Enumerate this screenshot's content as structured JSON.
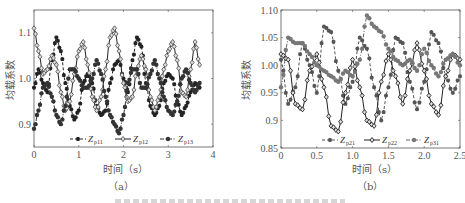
{
  "figure": {
    "panels": [
      {
        "id": "a",
        "sublabel": "（a）",
        "xlabel": "时间（s）",
        "ylabel": "均载系数",
        "xticks": [
          "0",
          "1",
          "2",
          "3",
          "4"
        ],
        "yticks": [
          "0.9",
          "1.0",
          "1.1"
        ],
        "legend": [
          {
            "base": "-Z",
            "sub": "p11"
          },
          {
            "base": "Z",
            "sub": "p12"
          },
          {
            "base": "Z",
            "sub": "p13"
          }
        ]
      },
      {
        "id": "b",
        "sublabel": "（b）",
        "xlabel": "时间（s）",
        "ylabel": "均载系数",
        "xticks": [
          "0",
          "0.5",
          "1.0",
          "1.5",
          "2.0",
          "2.5"
        ],
        "yticks": [
          "0.85",
          "0.9",
          "0.95",
          "1.00",
          "1.05",
          "1.10"
        ],
        "legend": [
          {
            "base": "Z",
            "sub": "p21"
          },
          {
            "base": "Z",
            "sub": "p22"
          },
          {
            "base": "Z",
            "sub": "p31"
          }
        ]
      }
    ]
  },
  "chart_data": [
    {
      "type": "line",
      "title": "(a)",
      "xlabel": "时间（s）",
      "ylabel": "均载系数",
      "xlim": [
        0,
        4
      ],
      "ylim": [
        0.85,
        1.15
      ],
      "xticks": [
        0,
        1,
        2,
        3,
        4
      ],
      "yticks": [
        0.9,
        1.0,
        1.1
      ],
      "grid": false,
      "legend_position": "bottom-inside",
      "series": [
        {
          "name": "Z_p11",
          "style": "dashed, star markers",
          "x": [
            0,
            0.1,
            0.2,
            0.3,
            0.4,
            0.5,
            0.6,
            0.7,
            0.8,
            0.9,
            1.0,
            1.1,
            1.2,
            1.3,
            1.4,
            1.5,
            1.6,
            1.7,
            1.8,
            1.9,
            2.0,
            2.1,
            2.2,
            2.3,
            2.4,
            2.5,
            2.6,
            2.7,
            2.8,
            2.9,
            3.0,
            3.1,
            3.2,
            3.3,
            3.4,
            3.5,
            3.6,
            3.7
          ],
          "values": [
            0.98,
            1.02,
            0.99,
            0.97,
            1.04,
            1.09,
            1.06,
            0.99,
            0.94,
            0.91,
            0.93,
            0.99,
            1.01,
            0.99,
            0.94,
            0.92,
            0.93,
            0.99,
            1.03,
            1.04,
            1.0,
            0.97,
            1.04,
            1.09,
            1.07,
            0.99,
            0.94,
            0.92,
            0.94,
            0.99,
            1.01,
            1.0,
            0.95,
            0.92,
            0.94,
            0.97,
            0.99,
            0.98
          ]
        },
        {
          "name": "Z_p12",
          "style": "solid, diamond markers",
          "x": [
            0,
            0.1,
            0.2,
            0.3,
            0.4,
            0.5,
            0.6,
            0.7,
            0.8,
            0.9,
            1.0,
            1.1,
            1.2,
            1.3,
            1.4,
            1.5,
            1.6,
            1.7,
            1.8,
            1.9,
            2.0,
            2.1,
            2.2,
            2.3,
            2.4,
            2.5,
            2.6,
            2.7,
            2.8,
            2.9,
            3.0,
            3.1,
            3.2,
            3.3,
            3.4,
            3.5,
            3.6,
            3.7
          ],
          "values": [
            1.11,
            1.06,
            1.01,
            1.02,
            1.05,
            1.03,
            0.97,
            0.93,
            0.95,
            1.01,
            1.06,
            1.08,
            1.03,
            0.96,
            0.93,
            0.96,
            1.02,
            1.09,
            1.11,
            1.06,
            0.99,
            0.95,
            0.96,
            1.02,
            1.05,
            1.02,
            0.96,
            0.93,
            0.96,
            1.02,
            1.06,
            1.08,
            1.04,
            0.97,
            0.96,
            1.02,
            1.08,
            1.03
          ]
        },
        {
          "name": "Z_p13",
          "style": "dash-dot, circle markers",
          "x": [
            0,
            0.1,
            0.2,
            0.3,
            0.4,
            0.5,
            0.6,
            0.7,
            0.8,
            0.9,
            1.0,
            1.1,
            1.2,
            1.3,
            1.4,
            1.5,
            1.6,
            1.7,
            1.8,
            1.9,
            2.0,
            2.1,
            2.2,
            2.3,
            2.4,
            2.5,
            2.6,
            2.7,
            2.8,
            2.9,
            3.0,
            3.1,
            3.2,
            3.3,
            3.4,
            3.5,
            3.6,
            3.7
          ],
          "values": [
            0.89,
            0.93,
            0.98,
            0.99,
            0.96,
            0.92,
            0.9,
            0.94,
            1.02,
            1.02,
            1.0,
            0.98,
            0.98,
            1.0,
            1.04,
            1.01,
            0.96,
            0.92,
            0.9,
            0.88,
            0.92,
            0.99,
            1.02,
            1.02,
            0.98,
            0.98,
            1.01,
            1.04,
            1.0,
            0.96,
            0.93,
            0.92,
            0.95,
            1.0,
            1.02,
            0.99,
            0.97,
            0.99
          ]
        }
      ]
    },
    {
      "type": "line",
      "title": "(b)",
      "xlabel": "时间（s）",
      "ylabel": "均载系数",
      "xlim": [
        0,
        2.5
      ],
      "ylim": [
        0.85,
        1.1
      ],
      "xticks": [
        0,
        0.5,
        1.0,
        1.5,
        2.0,
        2.5
      ],
      "yticks": [
        0.85,
        0.9,
        0.95,
        1.0,
        1.05,
        1.1
      ],
      "grid": false,
      "legend_position": "bottom-inside",
      "series": [
        {
          "name": "Z_p21",
          "style": "dashed, star markers",
          "x": [
            0,
            0.1,
            0.2,
            0.3,
            0.4,
            0.5,
            0.6,
            0.7,
            0.8,
            0.9,
            1.0,
            1.1,
            1.2,
            1.3,
            1.4,
            1.5,
            1.6,
            1.7,
            1.8,
            1.9,
            2.0,
            2.1,
            2.2,
            2.3,
            2.4,
            2.5
          ],
          "values": [
            1.01,
            0.93,
            0.96,
            1.04,
            1.0,
            0.95,
            1.07,
            1.06,
            0.99,
            0.93,
            0.97,
            1.05,
            1.03,
            0.96,
            0.9,
            0.96,
            1.05,
            1.04,
            0.97,
            0.92,
            0.97,
            1.06,
            1.04,
            0.98,
            0.95,
            0.98
          ]
        },
        {
          "name": "Z_p22",
          "style": "solid, diamond markers",
          "x": [
            0,
            0.1,
            0.2,
            0.3,
            0.4,
            0.5,
            0.6,
            0.7,
            0.8,
            0.9,
            1.0,
            1.1,
            1.2,
            1.3,
            1.4,
            1.5,
            1.6,
            1.7,
            1.8,
            1.9,
            2.0,
            2.1,
            2.2,
            2.3,
            2.4,
            2.5
          ],
          "values": [
            1.02,
            1.01,
            0.93,
            0.92,
            0.99,
            1.02,
            0.96,
            0.89,
            0.88,
            0.95,
            1.01,
            0.96,
            0.9,
            0.89,
            0.97,
            1.02,
            0.98,
            0.93,
            0.99,
            1.04,
            0.99,
            0.93,
            0.91,
            0.98,
            1.02,
            1.01
          ]
        },
        {
          "name": "Z_p31",
          "style": "dash-dot, circle markers",
          "x": [
            0,
            0.1,
            0.2,
            0.3,
            0.4,
            0.5,
            0.6,
            0.7,
            0.8,
            0.9,
            1.0,
            1.1,
            1.2,
            1.3,
            1.4,
            1.5,
            1.6,
            1.7,
            1.8,
            1.9,
            2.0,
            2.1,
            2.2,
            2.3,
            2.4,
            2.5
          ],
          "values": [
            0.96,
            1.05,
            1.04,
            1.04,
            1.02,
            1.0,
            0.99,
            0.98,
            0.97,
            0.99,
            0.98,
            1.01,
            1.09,
            1.07,
            1.06,
            1.03,
            1.01,
            1.0,
            1.01,
            0.99,
            1.03,
            1.0,
            0.98,
            1.01,
            1.02,
            1.0
          ]
        }
      ]
    }
  ]
}
